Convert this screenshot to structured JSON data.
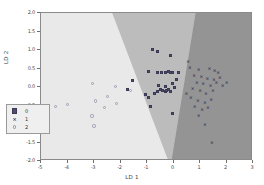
{
  "chart_data": {
    "type": "scatter",
    "title": "",
    "xlabel": "LD 1",
    "ylabel": "LD 2",
    "xlim": [
      -5,
      3
    ],
    "ylim": [
      -2.0,
      2.0
    ],
    "xticks": [
      "-5",
      "-4",
      "-3",
      "-2",
      "-1",
      "0",
      "1",
      "2",
      "3"
    ],
    "xtick_values": [
      -5,
      -4,
      -3,
      -2,
      -1,
      0,
      1,
      2,
      3
    ],
    "yticks": [
      "2.0",
      "1.5",
      "1.0",
      "0.5",
      "0.0",
      "-0.5",
      "-1.0",
      "-1.5",
      "-2.0"
    ],
    "ytick_values": [
      2.0,
      1.5,
      1.0,
      0.5,
      0.0,
      -0.5,
      -1.0,
      -1.5,
      -2.0
    ],
    "grid": false,
    "legend_position": "lower left",
    "legend": [
      {
        "label": "0",
        "marker": "square",
        "color": "#4d4d70"
      },
      {
        "label": "1",
        "marker": "x",
        "color": "#3c3c5c"
      },
      {
        "label": "2",
        "marker": "circle",
        "color": "#9a9ab0"
      }
    ],
    "decision_regions": [
      {
        "class": "2",
        "color": "#e8e8e8",
        "position": "left"
      },
      {
        "class": "0",
        "color": "#b8b8b8",
        "position": "middle"
      },
      {
        "class": "1",
        "color": "#8f8f8f",
        "position": "right"
      }
    ],
    "series": [
      {
        "name": "0",
        "marker": "square",
        "color": "#4d4d70",
        "points": [
          [
            -0.8,
            1.02
          ],
          [
            -0.62,
            0.95
          ],
          [
            -0.1,
            0.86
          ],
          [
            -1.55,
            0.18
          ],
          [
            -1.72,
            -0.07
          ],
          [
            -0.95,
            0.42
          ],
          [
            -0.62,
            0.4
          ],
          [
            -0.45,
            0.38
          ],
          [
            -0.32,
            0.4
          ],
          [
            -0.2,
            0.42
          ],
          [
            -0.12,
            0.4
          ],
          [
            -0.05,
            0.38
          ],
          [
            -1.05,
            -0.2
          ],
          [
            -0.95,
            -0.28
          ],
          [
            -0.88,
            -0.52
          ],
          [
            -0.7,
            -0.18
          ],
          [
            -0.6,
            -0.12
          ],
          [
            -0.48,
            -0.08
          ],
          [
            -0.4,
            -0.1
          ],
          [
            -0.32,
            -0.12
          ],
          [
            -0.25,
            -0.1
          ],
          [
            -0.18,
            -0.08
          ],
          [
            -0.12,
            -0.12
          ],
          [
            -0.3,
            0.02
          ],
          [
            -0.55,
            0.05
          ],
          [
            -0.02,
            0.1
          ],
          [
            0.05,
            -0.02
          ],
          [
            0.1,
            0.2
          ],
          [
            -0.05,
            -0.72
          ],
          [
            0.18,
            0.4
          ]
        ]
      },
      {
        "name": "1",
        "marker": "x",
        "color": "#3c3c5c",
        "points": [
          [
            0.62,
            0.52
          ],
          [
            0.95,
            0.46
          ],
          [
            1.35,
            0.5
          ],
          [
            1.55,
            0.42
          ],
          [
            0.78,
            0.3
          ],
          [
            1.05,
            0.26
          ],
          [
            1.28,
            0.22
          ],
          [
            1.52,
            0.18
          ],
          [
            1.75,
            0.24
          ],
          [
            0.88,
            0.12
          ],
          [
            1.12,
            0.08
          ],
          [
            1.4,
            0.04
          ],
          [
            1.62,
            0.1
          ],
          [
            1.85,
            0.02
          ],
          [
            0.72,
            -0.05
          ],
          [
            1.0,
            -0.12
          ],
          [
            1.22,
            -0.18
          ],
          [
            1.48,
            -0.1
          ],
          [
            0.65,
            -0.3
          ],
          [
            0.92,
            -0.38
          ],
          [
            1.18,
            -0.42
          ],
          [
            1.42,
            -0.35
          ],
          [
            0.8,
            -0.55
          ],
          [
            1.08,
            -0.62
          ],
          [
            1.3,
            -0.58
          ],
          [
            0.95,
            -0.78
          ],
          [
            1.18,
            -1.02
          ],
          [
            1.45,
            -1.5
          ],
          [
            0.55,
            0.68
          ],
          [
            1.68,
            0.38
          ],
          [
            2.0,
            0.12
          ],
          [
            0.48,
            -0.18
          ]
        ]
      },
      {
        "name": "2",
        "marker": "circle",
        "color": "#9a9ab0",
        "points": [
          [
            -3.05,
            0.1
          ],
          [
            -2.18,
            0.02
          ],
          [
            -2.95,
            -0.38
          ],
          [
            -2.15,
            -0.45
          ],
          [
            -2.6,
            -0.55
          ],
          [
            -3.08,
            -0.78
          ],
          [
            -3.0,
            -1.05
          ],
          [
            -4.0,
            -0.48
          ],
          [
            -4.45,
            -0.52
          ],
          [
            -1.62,
            -0.1
          ],
          [
            -2.48,
            -0.25
          ]
        ]
      }
    ]
  },
  "axis": {
    "xlabel": "LD 1",
    "ylabel": "LD 2"
  }
}
